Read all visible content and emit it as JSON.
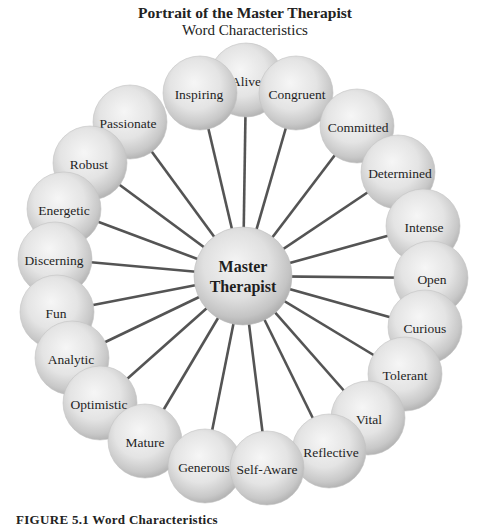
{
  "header": {
    "title": "Portrait of the Master Therapist",
    "subtitle": "Word Characteristics"
  },
  "center": {
    "label_line1": "Master",
    "label_line2": "Therapist",
    "cx": 243,
    "cy": 276,
    "r": 49
  },
  "colors": {
    "spoke": "#545454",
    "sphere_light": "#f4f4f4",
    "sphere_mid": "#dedede",
    "sphere_dark": "#b4b4b4",
    "text": "#1f1f1f"
  },
  "nodes": [
    {
      "label": "Alive",
      "cx": 246,
      "cy": 80,
      "tx": 246,
      "ty": 83
    },
    {
      "label": "Inspiring",
      "cx": 200,
      "cy": 93,
      "tx": 199,
      "ty": 96
    },
    {
      "label": "Congruent",
      "cx": 296,
      "cy": 93,
      "tx": 297,
      "ty": 96
    },
    {
      "label": "Committed",
      "cx": 357,
      "cy": 126,
      "tx": 358,
      "ty": 129
    },
    {
      "label": "Passionate",
      "cx": 130,
      "cy": 122,
      "tx": 128,
      "ty": 125
    },
    {
      "label": "Robust",
      "cx": 90,
      "cy": 163,
      "tx": 89,
      "ty": 166
    },
    {
      "label": "Determined",
      "cx": 398,
      "cy": 172,
      "tx": 400,
      "ty": 175
    },
    {
      "label": "Intense",
      "cx": 423,
      "cy": 226,
      "tx": 424,
      "ty": 229
    },
    {
      "label": "Energetic",
      "cx": 64,
      "cy": 209,
      "tx": 64,
      "ty": 212
    },
    {
      "label": "Discerning",
      "cx": 55,
      "cy": 259,
      "tx": 54,
      "ty": 262
    },
    {
      "label": "Open",
      "cx": 431,
      "cy": 278,
      "tx": 432,
      "ty": 281
    },
    {
      "label": "Curious",
      "cx": 425,
      "cy": 327,
      "tx": 425,
      "ty": 330
    },
    {
      "label": "Fun",
      "cx": 57,
      "cy": 312,
      "tx": 56,
      "ty": 315
    },
    {
      "label": "Analytic",
      "cx": 72,
      "cy": 358,
      "tx": 71,
      "ty": 361
    },
    {
      "label": "Tolerant",
      "cx": 405,
      "cy": 374,
      "tx": 405,
      "ty": 377
    },
    {
      "label": "Vital",
      "cx": 368,
      "cy": 418,
      "tx": 369,
      "ty": 421
    },
    {
      "label": "Optimistic",
      "cx": 100,
      "cy": 403,
      "tx": 99,
      "ty": 406
    },
    {
      "label": "Mature",
      "cx": 145,
      "cy": 441,
      "tx": 145,
      "ty": 444
    },
    {
      "label": "Reflective",
      "cx": 329,
      "cy": 451,
      "tx": 331,
      "ty": 454
    },
    {
      "label": "Generous",
      "cx": 205,
      "cy": 466,
      "tx": 204,
      "ty": 469
    },
    {
      "label": "Self-Aware",
      "cx": 267,
      "cy": 468,
      "tx": 267,
      "ty": 471
    }
  ],
  "node_radius": 37,
  "caption": "FIGURE 5.1   Word Characteristics"
}
